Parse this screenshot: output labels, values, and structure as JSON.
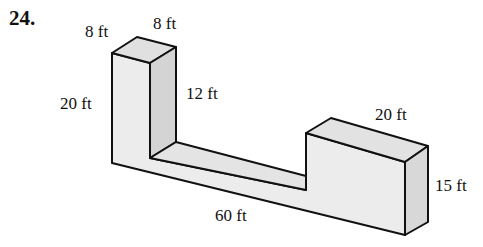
{
  "problem": {
    "number": "24."
  },
  "figure": {
    "type": "3d-solid",
    "dimensions": {
      "left_tower_top_width": "8 ft",
      "left_tower_top_depth": "8 ft",
      "left_tower_height": "20 ft",
      "channel_inner_height": "12 ft",
      "right_block_length": "20 ft",
      "right_block_height": "15 ft",
      "total_length": "60 ft"
    },
    "colors": {
      "stroke": "#111111",
      "face_front": "#ececec",
      "face_top": "#e2e2e2",
      "face_side": "#d6d6d6"
    }
  }
}
